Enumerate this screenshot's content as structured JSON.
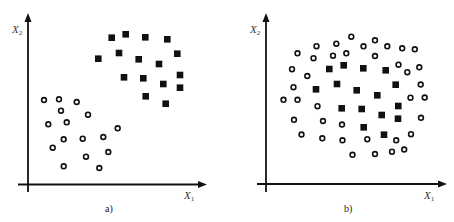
{
  "chart_data": [
    {
      "type": "scatter",
      "caption": "a)",
      "xlabel": "X1",
      "ylabel": "X2",
      "grid": false,
      "ticks": false,
      "legend": null,
      "description": "Two linearly separable clusters: squares upper-right, circles lower-left",
      "series": [
        {
          "name": "class-square",
          "marker": "filled-square",
          "points_px": [
            [
              111.7,
              37.7
            ],
            [
              125.7,
              34.3
            ],
            [
              145.3,
              37.3
            ],
            [
              167.3,
              39.3
            ],
            [
              98.3,
              58.7
            ],
            [
              119,
              53
            ],
            [
              138.7,
              59.3
            ],
            [
              159,
              64
            ],
            [
              177.3,
              53.7
            ],
            [
              124,
              77.3
            ],
            [
              143.3,
              78.3
            ],
            [
              163.3,
              84
            ],
            [
              180,
              75
            ],
            [
              180,
              87.7
            ],
            [
              145.7,
              96.3
            ],
            [
              165.7,
              103.7
            ]
          ]
        },
        {
          "name": "class-circle",
          "marker": "open-circle",
          "points_px": [
            [
              44,
              100
            ],
            [
              59,
              99.3
            ],
            [
              76.7,
              102
            ],
            [
              61,
              110.7
            ],
            [
              88,
              114.7
            ],
            [
              48.3,
              124.3
            ],
            [
              66.7,
              122.3
            ],
            [
              117.7,
              128.3
            ],
            [
              63.7,
              139.3
            ],
            [
              82.7,
              138.7
            ],
            [
              103.3,
              137
            ],
            [
              52.7,
              147.7
            ],
            [
              108.3,
              152
            ],
            [
              86,
              156.7
            ],
            [
              63.7,
              166.3
            ],
            [
              99.3,
              168
            ]
          ]
        }
      ]
    },
    {
      "type": "scatter",
      "caption": "b)",
      "xlabel": "X1",
      "ylabel": "X2",
      "grid": false,
      "ticks": false,
      "legend": null,
      "description": "Non-linearly separable: squares in center surrounded by ring of circles",
      "series": [
        {
          "name": "class-square",
          "marker": "filled-square",
          "points_px": [
            [
              329.3,
              69
            ],
            [
              343.7,
              65.3
            ],
            [
              363.3,
              68.3
            ],
            [
              385.7,
              70.3
            ],
            [
              316,
              89.3
            ],
            [
              337,
              84
            ],
            [
              356.7,
              90.3
            ],
            [
              377.3,
              95.3
            ],
            [
              395.7,
              84.7
            ],
            [
              341.7,
              108.3
            ],
            [
              361.7,
              109
            ],
            [
              381.7,
              115
            ],
            [
              398.3,
              106
            ],
            [
              398,
              118.7
            ],
            [
              363.7,
              127.3
            ],
            [
              384,
              134.7
            ]
          ]
        },
        {
          "name": "class-circle",
          "marker": "open-circle",
          "points_px": [
            [
              351.3,
              36.7
            ],
            [
              336.3,
              43.7
            ],
            [
              316.5,
              46.2
            ],
            [
              297.5,
              53.3
            ],
            [
              313.5,
              58.2
            ],
            [
              333,
              55.7
            ],
            [
              346.3,
              53.3
            ],
            [
              363.5,
              46.3
            ],
            [
              375,
              40.3
            ],
            [
              387.3,
              46.3
            ],
            [
              402.2,
              48.3
            ],
            [
              414.8,
              49.3
            ],
            [
              375,
              56
            ],
            [
              398.5,
              64.7
            ],
            [
              407.3,
              72.2
            ],
            [
              419.3,
              67.3
            ],
            [
              292,
              69.2
            ],
            [
              307.3,
              76
            ],
            [
              293.5,
              87.2
            ],
            [
              420.7,
              84.5
            ],
            [
              283.5,
              99.8
            ],
            [
              297.5,
              99.8
            ],
            [
              317.5,
              106.2
            ],
            [
              410.5,
              97.7
            ],
            [
              424.7,
              97.5
            ],
            [
              294,
              119.8
            ],
            [
              323,
              121
            ],
            [
              342,
              124.5
            ],
            [
              421,
              117.8
            ],
            [
              301.5,
              134.5
            ],
            [
              322.3,
              138.3
            ],
            [
              342.5,
              140.3
            ],
            [
              367.3,
              139.2
            ],
            [
              396.2,
              140.3
            ],
            [
              411,
              134.2
            ],
            [
              352.5,
              154.8
            ],
            [
              375,
              154
            ],
            [
              392,
              151.7
            ],
            [
              404.2,
              149.5
            ]
          ]
        }
      ]
    }
  ],
  "figure": {
    "panels": [
      {
        "caption": "a)",
        "xlabel_main": "X",
        "xlabel_sub": "1",
        "ylabel_main": "X",
        "ylabel_sub": "2"
      },
      {
        "caption": "b)",
        "xlabel_main": "X",
        "xlabel_sub": "1",
        "ylabel_main": "X",
        "ylabel_sub": "2"
      }
    ]
  },
  "colors": {
    "marker": "#111111",
    "axis": "#111111",
    "background": "#ffffff"
  }
}
